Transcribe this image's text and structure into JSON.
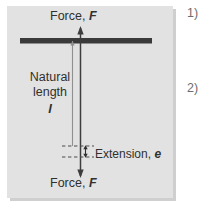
{
  "figure": {
    "name": "hookes-law-extension-diagram",
    "panel_background": "#e2e2e2",
    "page_background": "#ffffff",
    "ink_color": "#30302f",
    "support_bar_color": "#3a3a3a",
    "guide_line_color": "#8f8f8f"
  },
  "labels": {
    "force_top": "Force, ",
    "force_top_symbol": "F",
    "force_bottom": "Force, ",
    "force_bottom_symbol": "F",
    "natural_line1": "Natural",
    "natural_line2": "length",
    "natural_symbol": "l",
    "extension": "Extension, ",
    "extension_symbol": "e"
  },
  "list": {
    "items": [
      {
        "marker": "1)"
      },
      {
        "marker": "2)"
      }
    ]
  },
  "diagram_elements": {
    "support_bar": "horizontal-fixed-support",
    "force_arrow": "double-headed-vertical-force-arrow",
    "natural_length_line": "thin-vertical-measure-line",
    "extension_bracket": "small-double-headed-extension-arrow",
    "dashed_guides": "two-horizontal-dashed-reference-lines"
  }
}
